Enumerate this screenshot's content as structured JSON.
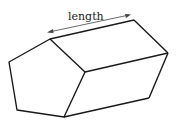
{
  "diagram": {
    "dimension_label": "length",
    "colors": {
      "edge": "#1a1a1a",
      "dimension_line": "#444444",
      "text": "#222222",
      "background": "#ffffff"
    },
    "front_face_vertices": [
      [
        50,
        39
      ],
      [
        9,
        62
      ],
      [
        17,
        110
      ],
      [
        64,
        117
      ],
      [
        85,
        72
      ]
    ],
    "back_face_visible_vertices": [
      [
        134,
        20
      ],
      [
        168,
        53
      ],
      [
        149,
        98
      ]
    ],
    "dimension_arrow": {
      "from": [
        47,
        33
      ],
      "to": [
        131,
        16
      ]
    }
  }
}
